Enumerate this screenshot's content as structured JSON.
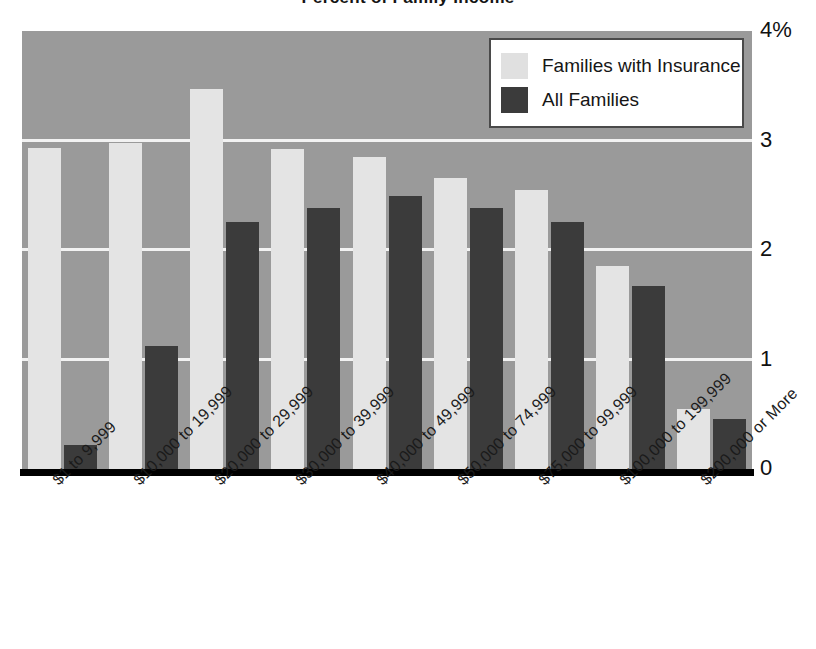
{
  "chart_data": {
    "type": "bar",
    "title": "",
    "xlabel": "",
    "ylabel": "",
    "ylim": [
      0,
      4
    ],
    "yticks": [
      0,
      1,
      2,
      3,
      4
    ],
    "ytick_labels": [
      "0",
      "1",
      "2",
      "3",
      "4%"
    ],
    "grid": true,
    "legend_position": "top-right",
    "categories": [
      "$1 to 9,999",
      "$10,000 to 19,999",
      "$20,000 to 29,999",
      "$30,000 to 39,999",
      "$40,000 to 49,999",
      "$50,000 to 74,999",
      "$75,000 to 99,999",
      "$100,000 to 199,999",
      "$200,000 or More"
    ],
    "series": [
      {
        "name": "Families with Insurance",
        "color": "#e4e4e4",
        "values": [
          2.93,
          2.98,
          3.47,
          2.92,
          2.85,
          2.66,
          2.55,
          1.85,
          0.55
        ]
      },
      {
        "name": "All Families",
        "color": "#3b3b3b",
        "values": [
          0.22,
          1.12,
          2.26,
          2.38,
          2.49,
          2.38,
          2.26,
          1.67,
          0.46
        ]
      }
    ]
  },
  "legend": {
    "items": [
      {
        "label": "Families with Insurance",
        "swatch": "light"
      },
      {
        "label": "All Families",
        "swatch": "dark"
      }
    ]
  },
  "axes": {
    "y_tick_labels": [
      "4%",
      "3",
      "2",
      "1",
      "0"
    ]
  },
  "colors": {
    "plot_background": "#9a9a9a",
    "gridline": "#f2f2f2",
    "baseline": "#000000",
    "series_light": "#e4e4e4",
    "series_dark": "#3b3b3b",
    "legend_border": "#4a4a4a"
  },
  "title_fragment": "Percent of Family Income"
}
